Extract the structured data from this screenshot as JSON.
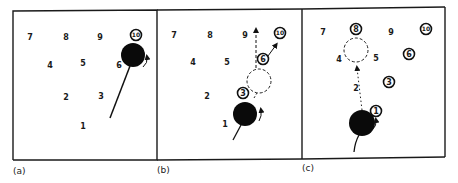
{
  "figure": {
    "panels": [
      {
        "label": "(a)",
        "balls": [
          {
            "n": "7",
            "x": 30,
            "y": 40,
            "circled": false
          },
          {
            "n": "8",
            "x": 66,
            "y": 40,
            "circled": false
          },
          {
            "n": "9",
            "x": 100,
            "y": 40,
            "circled": false
          },
          {
            "n": "10",
            "x": 136,
            "y": 38,
            "circled": true
          },
          {
            "n": "4",
            "x": 50,
            "y": 68,
            "circled": false
          },
          {
            "n": "5",
            "x": 83,
            "y": 66,
            "circled": false
          },
          {
            "n": "6",
            "x": 119,
            "y": 68,
            "circled": false
          },
          {
            "n": "2",
            "x": 66,
            "y": 100,
            "circled": false
          },
          {
            "n": "3",
            "x": 101,
            "y": 99,
            "circled": false
          },
          {
            "n": "1",
            "x": 83,
            "y": 129,
            "circled": false
          }
        ],
        "cue_ball": {
          "x": 133,
          "y": 55,
          "r": 12
        },
        "cue_line": {
          "x1": 110,
          "y1": 118,
          "x2": 130,
          "y2": 66
        }
      },
      {
        "label": "(b)",
        "balls": [
          {
            "n": "7",
            "x": 174,
            "y": 38,
            "circled": false
          },
          {
            "n": "8",
            "x": 210,
            "y": 38,
            "circled": false
          },
          {
            "n": "9",
            "x": 245,
            "y": 38,
            "circled": false
          },
          {
            "n": "10",
            "x": 280,
            "y": 36,
            "circled": true
          },
          {
            "n": "4",
            "x": 193,
            "y": 65,
            "circled": false
          },
          {
            "n": "5",
            "x": 227,
            "y": 65,
            "circled": false
          },
          {
            "n": "6",
            "x": 263,
            "y": 62,
            "circled": true
          },
          {
            "n": "2",
            "x": 207,
            "y": 99,
            "circled": false
          },
          {
            "n": "3",
            "x": 243,
            "y": 96,
            "circled": true
          },
          {
            "n": "1",
            "x": 225,
            "y": 127,
            "circled": false
          }
        ],
        "ghost_ball": {
          "x": 259,
          "y": 81,
          "r": 12
        },
        "cue_ball": {
          "x": 245,
          "y": 114,
          "r": 12
        },
        "cue_line": {
          "x1": 233,
          "y1": 140,
          "x2": 241,
          "y2": 125
        }
      },
      {
        "label": "(c)",
        "balls": [
          {
            "n": "7",
            "x": 323,
            "y": 35,
            "circled": false
          },
          {
            "n": "8",
            "x": 356,
            "y": 32,
            "circled": true
          },
          {
            "n": "9",
            "x": 391,
            "y": 35,
            "circled": false
          },
          {
            "n": "10",
            "x": 426,
            "y": 32,
            "circled": true
          },
          {
            "n": "4",
            "x": 339,
            "y": 62,
            "circled": false
          },
          {
            "n": "5",
            "x": 376,
            "y": 61,
            "circled": false
          },
          {
            "n": "6",
            "x": 409,
            "y": 57,
            "circled": true
          },
          {
            "n": "2",
            "x": 356,
            "y": 91,
            "circled": false
          },
          {
            "n": "3",
            "x": 389,
            "y": 85,
            "circled": true
          },
          {
            "n": "1",
            "x": 376,
            "y": 114,
            "circled": true
          }
        ],
        "ghost_ball": {
          "x": 356,
          "y": 50,
          "r": 12
        },
        "cue_ball": {
          "x": 362,
          "y": 123,
          "r": 13
        },
        "cue_line": {
          "x1": 354,
          "y1": 152,
          "x2": 358,
          "y2": 135
        }
      }
    ]
  }
}
